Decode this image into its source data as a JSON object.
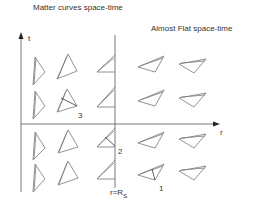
{
  "diagram": {
    "title_left": "Matter curves space-time",
    "title_right": "Almost Flat space-time",
    "axis_t_label": "t",
    "axis_r_label": "r",
    "boundary_label_main": "r=R",
    "boundary_label_sub": "S",
    "markers": [
      "1",
      "2",
      "3"
    ],
    "colors": {
      "line": "#555555",
      "triangle": "#777777",
      "text": "#333333"
    }
  }
}
